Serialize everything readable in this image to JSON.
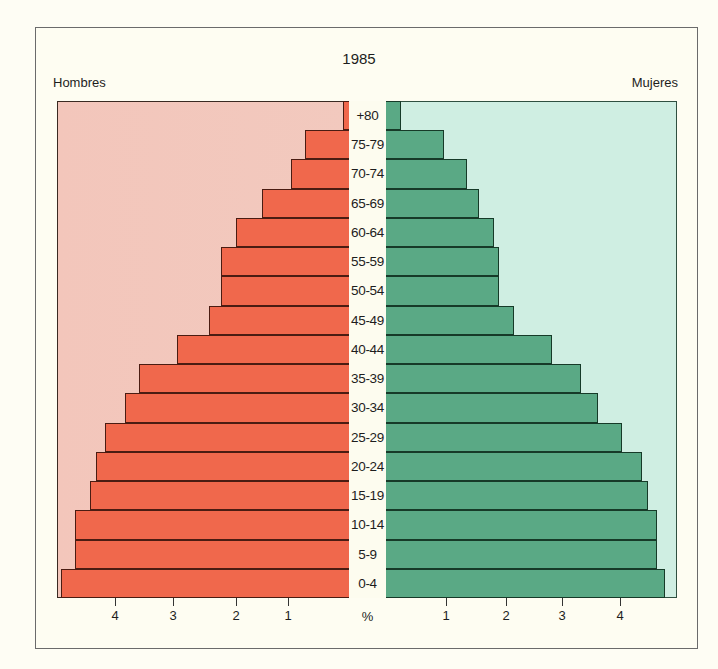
{
  "chart_data": {
    "type": "bar",
    "subtype": "population-pyramid",
    "title": "1985",
    "xlabel": "%",
    "ylabel": "",
    "left_label": "Hombres",
    "right_label": "Mujeres",
    "categories": [
      "+80",
      "75-79",
      "70-74",
      "65-69",
      "60-64",
      "55-59",
      "50-54",
      "45-49",
      "40-44",
      "35-39",
      "30-34",
      "25-29",
      "20-24",
      "15-19",
      "10-14",
      "5-9",
      "0-4"
    ],
    "series": [
      {
        "name": "Hombres",
        "color": "#f0684c",
        "values": [
          0.1,
          0.75,
          1.0,
          1.5,
          1.95,
          2.2,
          2.2,
          2.4,
          2.95,
          3.6,
          3.85,
          4.2,
          4.35,
          4.45,
          4.7,
          4.7,
          4.95
        ]
      },
      {
        "name": "Mujeres",
        "color": "#5aa985",
        "values": [
          0.25,
          1.0,
          1.4,
          1.6,
          1.85,
          1.95,
          1.95,
          2.2,
          2.85,
          3.35,
          3.65,
          4.05,
          4.4,
          4.5,
          4.65,
          4.65,
          4.8
        ]
      }
    ],
    "xticks_left": [
      "4",
      "3",
      "2",
      "1"
    ],
    "xticks_right": [
      "1",
      "2",
      "3",
      "4"
    ],
    "xlim": [
      0,
      5
    ],
    "grid": false,
    "legend": "side labels (top-left: Hombres, top-right: Mujeres)",
    "background_colors": {
      "male_panel": "#f3c6bb",
      "female_panel": "#cfeee2"
    }
  },
  "labels": {
    "title": "1985",
    "left": "Hombres",
    "right": "Mujeres",
    "axis_unit": "%"
  }
}
